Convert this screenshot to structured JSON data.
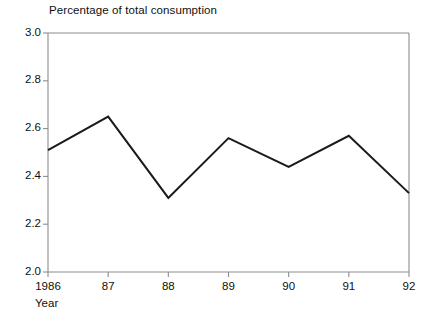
{
  "chart_data": {
    "type": "line",
    "title": "Percentage of total consumption",
    "xlabel": "Year",
    "ylabel": "",
    "categories": [
      "1986",
      "87",
      "88",
      "89",
      "90",
      "91",
      "92"
    ],
    "x": [
      1986,
      1987,
      1988,
      1989,
      1990,
      1991,
      1992
    ],
    "values": [
      2.51,
      2.65,
      2.31,
      2.56,
      2.44,
      2.57,
      2.33
    ],
    "series": [
      {
        "name": "Percentage of total consumption",
        "values": [
          2.51,
          2.65,
          2.31,
          2.56,
          2.44,
          2.57,
          2.33
        ]
      }
    ],
    "ylim": [
      2.0,
      3.0
    ],
    "yticks": [
      "2.0",
      "2.2",
      "2.4",
      "2.6",
      "2.8",
      "3.0"
    ],
    "ytick_values": [
      2.0,
      2.2,
      2.4,
      2.6,
      2.8,
      3.0
    ],
    "xticks": [
      "1986",
      "87",
      "88",
      "89",
      "90",
      "91",
      "92"
    ],
    "grid": false,
    "legend": false,
    "legend_position": "none",
    "line_color": "#1a1a1a",
    "axis_color": "#808080",
    "background_color": "#ffffff"
  },
  "chart": {
    "title": "Percentage of total consumption",
    "xaxis_title": "Year"
  }
}
